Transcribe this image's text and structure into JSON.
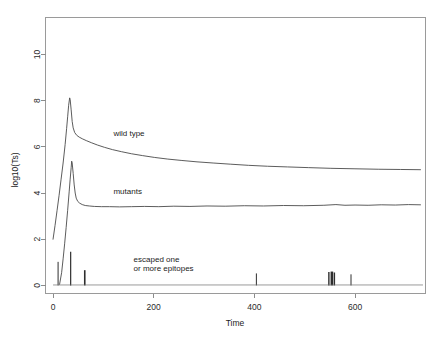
{
  "chart_data": {
    "type": "line",
    "title": "",
    "xlabel": "Time",
    "ylabel": "log10(Ts)",
    "xlim": [
      -15,
      740
    ],
    "ylim": [
      -0.35,
      11.6
    ],
    "xticks": [
      0,
      200,
      400,
      600
    ],
    "xticklabels": [
      "0",
      "200",
      "400",
      "600"
    ],
    "yticks": [
      0,
      2,
      4,
      6,
      8,
      10
    ],
    "yticklabels": [
      "0",
      "2",
      "4",
      "6",
      "8",
      "10"
    ],
    "grid": false,
    "legend_position": "inline-annotations",
    "line_color": "#4a4a4a",
    "axis_color": "#8c8c8c",
    "series": [
      {
        "name": "wild type",
        "label": "wild type",
        "label_x": 120,
        "label_y": 6.45,
        "points": [
          [
            0,
            2.0
          ],
          [
            4,
            2.6
          ],
          [
            8,
            3.25
          ],
          [
            12,
            3.9
          ],
          [
            16,
            4.6
          ],
          [
            20,
            5.3
          ],
          [
            24,
            6.1
          ],
          [
            27,
            6.8
          ],
          [
            29,
            7.3
          ],
          [
            31,
            7.8
          ],
          [
            33,
            8.12
          ],
          [
            34,
            8.05
          ],
          [
            36,
            7.6
          ],
          [
            38,
            7.1
          ],
          [
            40,
            6.82
          ],
          [
            43,
            6.62
          ],
          [
            47,
            6.5
          ],
          [
            52,
            6.42
          ],
          [
            58,
            6.35
          ],
          [
            66,
            6.27
          ],
          [
            76,
            6.18
          ],
          [
            88,
            6.08
          ],
          [
            102,
            5.98
          ],
          [
            118,
            5.88
          ],
          [
            136,
            5.79
          ],
          [
            156,
            5.7
          ],
          [
            178,
            5.62
          ],
          [
            202,
            5.54
          ],
          [
            228,
            5.47
          ],
          [
            256,
            5.41
          ],
          [
            286,
            5.35
          ],
          [
            318,
            5.3
          ],
          [
            352,
            5.25
          ],
          [
            388,
            5.2
          ],
          [
            426,
            5.16
          ],
          [
            466,
            5.13
          ],
          [
            508,
            5.1
          ],
          [
            552,
            5.07
          ],
          [
            598,
            5.05
          ],
          [
            646,
            5.03
          ],
          [
            690,
            5.02
          ],
          [
            730,
            5.01
          ]
        ]
      },
      {
        "name": "mutants",
        "label": "mutants",
        "label_x": 120,
        "label_y": 3.95,
        "points": [
          [
            13,
            0.05
          ],
          [
            17,
            0.55
          ],
          [
            20,
            1.15
          ],
          [
            23,
            1.8
          ],
          [
            26,
            2.5
          ],
          [
            29,
            3.25
          ],
          [
            32,
            4.05
          ],
          [
            34,
            4.6
          ],
          [
            36,
            5.1
          ],
          [
            37,
            5.38
          ],
          [
            38,
            5.3
          ],
          [
            40,
            4.85
          ],
          [
            42,
            4.35
          ],
          [
            44,
            4.0
          ],
          [
            46,
            3.78
          ],
          [
            49,
            3.64
          ],
          [
            53,
            3.56
          ],
          [
            58,
            3.5
          ],
          [
            64,
            3.46
          ],
          [
            72,
            3.44
          ],
          [
            82,
            3.42
          ],
          [
            96,
            3.41
          ],
          [
            112,
            3.41
          ],
          [
            132,
            3.4
          ],
          [
            156,
            3.41
          ],
          [
            182,
            3.42
          ],
          [
            210,
            3.41
          ],
          [
            240,
            3.43
          ],
          [
            272,
            3.42
          ],
          [
            306,
            3.44
          ],
          [
            342,
            3.43
          ],
          [
            380,
            3.45
          ],
          [
            418,
            3.44
          ],
          [
            458,
            3.46
          ],
          [
            498,
            3.45
          ],
          [
            538,
            3.47
          ],
          [
            562,
            3.5
          ],
          [
            580,
            3.47
          ],
          [
            600,
            3.48
          ],
          [
            626,
            3.47
          ],
          [
            652,
            3.49
          ],
          [
            680,
            3.48
          ],
          [
            706,
            3.5
          ],
          [
            730,
            3.49
          ]
        ]
      }
    ],
    "escape_events": {
      "name": "escaped one or more epitopes",
      "label_line1": "escaped one",
      "label_line2": "or more epitopes",
      "label_x": 160,
      "label_y": 1.0,
      "spikes": [
        {
          "x": 10,
          "height": 1.02,
          "width": 1.0
        },
        {
          "x": 35,
          "height": 1.46,
          "width": 1.2
        },
        {
          "x": 63,
          "height": 0.66,
          "width": 1.6
        },
        {
          "x": 404,
          "height": 0.52,
          "width": 1.0
        },
        {
          "x": 548,
          "height": 0.58,
          "width": 1.4
        },
        {
          "x": 554,
          "height": 0.6,
          "width": 2.6
        },
        {
          "x": 559,
          "height": 0.56,
          "width": 1.4
        },
        {
          "x": 592,
          "height": 0.48,
          "width": 1.0
        }
      ]
    }
  }
}
